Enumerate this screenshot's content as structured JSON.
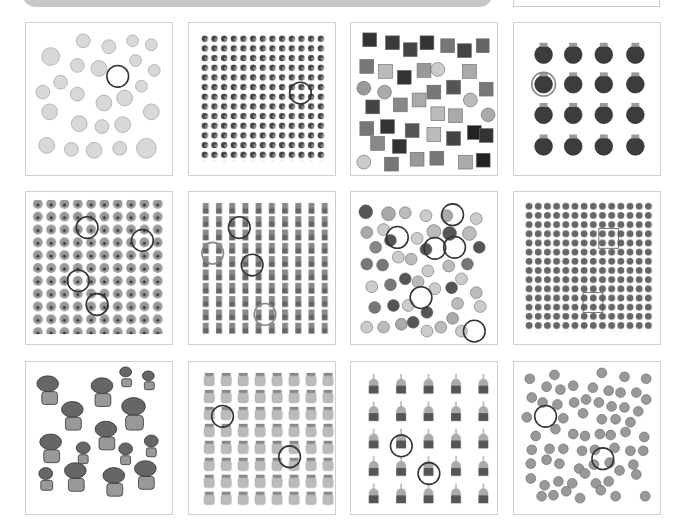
{
  "header": {
    "bar_color": "#c8c8c8"
  },
  "grid": {
    "columns": 4,
    "rows": 3,
    "tiles": [
      {
        "id": "unicorn",
        "subject": "unicorn heads",
        "layout": "scatter",
        "marked_count": 1,
        "tone": "light gray"
      },
      {
        "id": "beetle",
        "subject": "small dark bugs",
        "layout": "grid 13x13",
        "marked_count": 1,
        "tone": "dark"
      },
      {
        "id": "potion",
        "subject": "potion bottles with faces",
        "layout": "scatter",
        "marked_count": 0,
        "tone": "mixed"
      },
      {
        "id": "strawberry",
        "subject": "dark strawberries",
        "layout": "grid 4x4",
        "marked_count": 1,
        "tone": "dark"
      },
      {
        "id": "bear",
        "subject": "bear faces",
        "layout": "scatter dense",
        "marked_count": 4,
        "tone": "gray"
      },
      {
        "id": "plant-pot",
        "subject": "small potted plants",
        "layout": "grid 10x10",
        "marked_count": 4,
        "tone": "gray"
      },
      {
        "id": "cupcake-mix",
        "subject": "mixed cupcakes",
        "layout": "scatter",
        "marked_count": 6,
        "tone": "mixed"
      },
      {
        "id": "dot",
        "subject": "small round dots",
        "layout": "grid 14x14",
        "marked_count": 2,
        "tone": "gray"
      },
      {
        "id": "houseplant",
        "subject": "houseplants in smiling pots",
        "layout": "scatter",
        "marked_count": 0,
        "tone": "gray"
      },
      {
        "id": "jar",
        "subject": "jars",
        "layout": "grid 8x8",
        "marked_count": 2,
        "tone": "light gray"
      },
      {
        "id": "birthday-cupcake",
        "subject": "cupcakes with candle",
        "layout": "grid 5x5",
        "marked_count": 2,
        "tone": "gray"
      },
      {
        "id": "smiley",
        "subject": "grinning faces",
        "layout": "scatter",
        "marked_count": 2,
        "tone": "gray"
      }
    ]
  }
}
